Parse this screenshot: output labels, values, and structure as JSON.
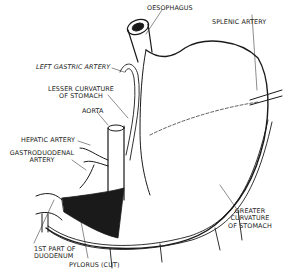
{
  "diagram": {
    "labels": {
      "oesophagus": "OESOPHAGUS",
      "splenic_artery": "SPLENIC ARTERY",
      "left_gastric_artery": "LEFT GASTRIC ARTERY",
      "lesser_curvature_1": "LESSER CURVATURE",
      "lesser_curvature_2": "OF STOMACH",
      "aorta": "AORTA",
      "hepatic_artery": "HEPATIC ARTERY",
      "gastroduodenal_1": "GASTRODUODENAL",
      "gastroduodenal_2": "ARTERY",
      "duodenum_1": "1ST PART OF",
      "duodenum_2": "DUODENUM",
      "pylorus": "PYLORUS (CUT)",
      "greater_curvature_1": "GREATER",
      "greater_curvature_2": "CURVATURE",
      "greater_curvature_3": "OF STOMACH"
    },
    "colors": {
      "ink": "#1a1a1a",
      "background": "#ffffff"
    }
  }
}
